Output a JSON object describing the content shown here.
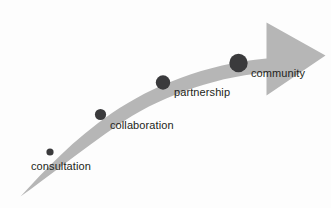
{
  "diagram": {
    "type": "arrow-continuum",
    "title": "",
    "background_color": "#fdfdfd",
    "arrow": {
      "name": "progression-arrow",
      "fill_color": "#b6b6b6",
      "direction": "left-to-right, ascending"
    },
    "dot_color": "#3a3a3c",
    "label_color": "#231f20",
    "stages": [
      {
        "id": "consultation",
        "label": "consultation",
        "order": 1,
        "dot": {
          "cx": 50,
          "cy": 152,
          "r": 3.6
        },
        "label_pos": {
          "x": 31,
          "y": 170
        }
      },
      {
        "id": "collaboration",
        "label": "collaboration",
        "order": 2,
        "dot": {
          "cx": 100.5,
          "cy": 114.5,
          "r": 5.6
        },
        "label_pos": {
          "x": 110,
          "y": 129
        }
      },
      {
        "id": "partnership",
        "label": "partnership",
        "order": 3,
        "dot": {
          "cx": 163,
          "cy": 82.5,
          "r": 7.2
        },
        "label_pos": {
          "x": 174,
          "y": 96
        }
      },
      {
        "id": "community",
        "label": "community",
        "order": 4,
        "dot": {
          "cx": 238.5,
          "cy": 63,
          "r": 9.2
        },
        "label_pos": {
          "x": 251,
          "y": 77
        }
      }
    ]
  }
}
